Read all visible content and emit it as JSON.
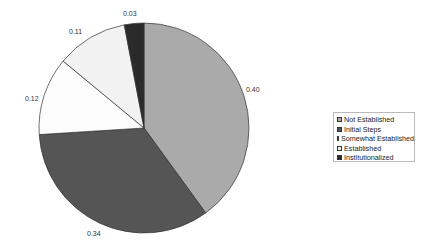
{
  "chart_data": {
    "type": "pie",
    "title": "",
    "categories": [
      "Not Established",
      "Initial Steps",
      "Somewhat Established",
      "Established",
      "Institutionalized"
    ],
    "values": [
      0.4,
      0.34,
      0.12,
      0.11,
      0.03
    ],
    "colors": [
      "#aaaaaa",
      "#555555",
      "#fcfcfc",
      "#f2f2f2",
      "#2b2b2b"
    ],
    "data_labels": [
      "0.40",
      "0.34",
      "0.12",
      "0.11",
      "0.03"
    ],
    "legend_position": "right",
    "start_angle": "12 o'clock",
    "direction": "clockwise"
  },
  "labels": {
    "l0": "0.40",
    "l1": "0.34",
    "l2": "0.12",
    "l3": "0.11",
    "l4": "0.03"
  },
  "legend": {
    "items": [
      {
        "label": "Not Established"
      },
      {
        "label": "Initial Steps"
      },
      {
        "label": "Somewhat Established"
      },
      {
        "label": "Established"
      },
      {
        "label": "Institutionalized"
      }
    ]
  }
}
